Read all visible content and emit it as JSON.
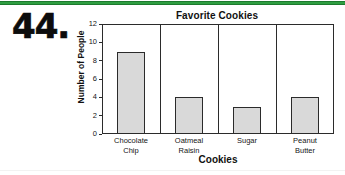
{
  "question_number": "44.",
  "rules": {
    "top_color": "#2f9e41",
    "bottom_color": "#f2f2f2"
  },
  "chart_data": {
    "type": "bar",
    "title": "Favorite Cookies",
    "xlabel": "Cookies",
    "ylabel": "Number of People",
    "categories": [
      "Chocolate Chip",
      "Oatmeal Raisin",
      "Sugar",
      "Peanut Butter"
    ],
    "category_lines": [
      [
        "Chocolate",
        "Chip"
      ],
      [
        "Oatmeal",
        "Raisin"
      ],
      [
        "Sugar",
        ""
      ],
      [
        "Peanut",
        "Butter"
      ]
    ],
    "values": [
      9,
      4,
      3,
      4
    ],
    "ylim": [
      0,
      12
    ],
    "ytick_values": [
      12,
      10,
      8,
      6,
      4,
      2,
      0
    ],
    "ytick_labels": [
      "12",
      "10",
      "8",
      "6",
      "4",
      "2",
      "0"
    ],
    "grid": false,
    "legend": null,
    "bar_fill": "#d9d9d9",
    "bar_stroke": "#2b2b2b",
    "axis_color": "#2b2b2b"
  }
}
